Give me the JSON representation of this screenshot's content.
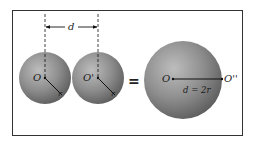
{
  "diagram": {
    "left_sphere": {
      "center_label": "O",
      "radius_label": "r"
    },
    "middle_sphere": {
      "center_label": "O'",
      "radius_label": "r"
    },
    "separation_label": "d",
    "equals_sign": "=",
    "merged_sphere": {
      "center_label": "O",
      "far_point_label": "O''",
      "relation_label": "d = 2r"
    },
    "colors": {
      "sphere_light": "#b9b9b9",
      "sphere_mid": "#8a8a8a",
      "sphere_dark": "#5a5a5a",
      "frame": "#333333",
      "line": "#111111"
    }
  }
}
